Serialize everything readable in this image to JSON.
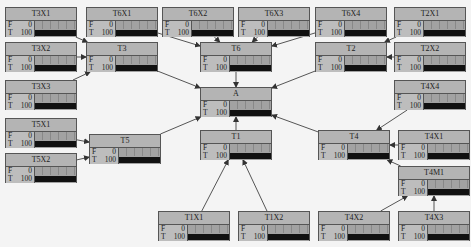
{
  "colors": {
    "background": "#f4f4f4",
    "node_fill": "#b8b8b8",
    "bar_fill": "#111111",
    "edge": "#555555"
  },
  "state_labels": {
    "false": "F",
    "true": "T"
  },
  "nodes": {
    "T3X1": {
      "label": "T3X1",
      "F": "0",
      "T": "100",
      "t_pct": 100,
      "x": 5,
      "y": 7
    },
    "T6X1": {
      "label": "T6X1",
      "F": "0",
      "T": "100",
      "t_pct": 100,
      "x": 86,
      "y": 7
    },
    "T6X2": {
      "label": "T6X2",
      "F": "0",
      "T": "100",
      "t_pct": 100,
      "x": 162,
      "y": 7
    },
    "T6X3": {
      "label": "T6X3",
      "F": "0",
      "T": "100",
      "t_pct": 100,
      "x": 238,
      "y": 7
    },
    "T6X4": {
      "label": "T6X4",
      "F": "0",
      "T": "100",
      "t_pct": 100,
      "x": 315,
      "y": 7
    },
    "T2X1": {
      "label": "T2X1",
      "F": "0",
      "T": "100",
      "t_pct": 100,
      "x": 394,
      "y": 7
    },
    "T3X2": {
      "label": "T3X2",
      "F": "0",
      "T": "100",
      "t_pct": 100,
      "x": 5,
      "y": 42
    },
    "T3": {
      "label": "T3",
      "F": "0",
      "T": "100",
      "t_pct": 100,
      "x": 86,
      "y": 42
    },
    "T6": {
      "label": "T6",
      "F": "0",
      "T": "100",
      "t_pct": 100,
      "x": 200,
      "y": 42
    },
    "T2": {
      "label": "T2",
      "F": "0",
      "T": "100",
      "t_pct": 100,
      "x": 315,
      "y": 42
    },
    "T2X2": {
      "label": "T2X2",
      "F": "0",
      "T": "100",
      "t_pct": 100,
      "x": 394,
      "y": 42
    },
    "T3X3": {
      "label": "T3X3",
      "F": "0",
      "T": "100",
      "t_pct": 100,
      "x": 5,
      "y": 80
    },
    "T4X4": {
      "label": "T4X4",
      "F": "0",
      "T": "100",
      "t_pct": 100,
      "x": 394,
      "y": 80
    },
    "A": {
      "label": "A",
      "F": "0",
      "T": "100",
      "t_pct": 100,
      "x": 200,
      "y": 87
    },
    "T5X1": {
      "label": "T5X1",
      "F": "0",
      "T": "100",
      "t_pct": 100,
      "x": 5,
      "y": 118
    },
    "T1": {
      "label": "T1",
      "F": "0",
      "T": "100",
      "t_pct": 100,
      "x": 200,
      "y": 130
    },
    "T4": {
      "label": "T4",
      "F": "0",
      "T": "100",
      "t_pct": 100,
      "x": 318,
      "y": 130
    },
    "T4X1": {
      "label": "T4X1",
      "F": "0",
      "T": "100",
      "t_pct": 100,
      "x": 398,
      "y": 130
    },
    "T5": {
      "label": "T5",
      "F": "0",
      "T": "100",
      "t_pct": 100,
      "x": 89,
      "y": 134
    },
    "T5X2": {
      "label": "T5X2",
      "F": "0",
      "T": "100",
      "t_pct": 100,
      "x": 5,
      "y": 153
    },
    "T4M1": {
      "label": "T4M1",
      "F": "0",
      "T": "100",
      "t_pct": 100,
      "x": 398,
      "y": 166
    },
    "T1X1": {
      "label": "T1X1",
      "F": "0",
      "T": "100",
      "t_pct": 100,
      "x": 158,
      "y": 211
    },
    "T1X2": {
      "label": "T1X2",
      "F": "0",
      "T": "100",
      "t_pct": 100,
      "x": 238,
      "y": 211
    },
    "T4X2": {
      "label": "T4X2",
      "F": "0",
      "T": "100",
      "t_pct": 100,
      "x": 318,
      "y": 211
    },
    "T4X3": {
      "label": "T4X3",
      "F": "0",
      "T": "100",
      "t_pct": 100,
      "x": 398,
      "y": 211
    }
  },
  "edges": [
    [
      "T3X1",
      "T3"
    ],
    [
      "T3X2",
      "T3"
    ],
    [
      "T3X3",
      "T3"
    ],
    [
      "T6X1",
      "T6"
    ],
    [
      "T6X2",
      "T6"
    ],
    [
      "T6X3",
      "T6"
    ],
    [
      "T6X4",
      "T6"
    ],
    [
      "T2X1",
      "T2"
    ],
    [
      "T2X2",
      "T2"
    ],
    [
      "T4X4",
      "T4"
    ],
    [
      "T4X1",
      "T4"
    ],
    [
      "T4M1",
      "T4"
    ],
    [
      "T4X2",
      "T4M1"
    ],
    [
      "T4X3",
      "T4M1"
    ],
    [
      "T5X1",
      "T5"
    ],
    [
      "T5X2",
      "T5"
    ],
    [
      "T1X1",
      "T1"
    ],
    [
      "T1X2",
      "T1"
    ],
    [
      "T3",
      "A"
    ],
    [
      "T6",
      "A"
    ],
    [
      "T2",
      "A"
    ],
    [
      "T5",
      "A"
    ],
    [
      "T1",
      "A"
    ],
    [
      "T4",
      "A"
    ]
  ]
}
